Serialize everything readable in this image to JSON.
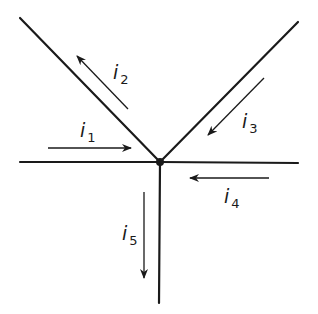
{
  "diagram": {
    "node": {
      "x": 160,
      "y": 162,
      "label": "junction"
    },
    "colors": {
      "line": "#1a1a1a",
      "background": "#ffffff"
    },
    "wires": [
      {
        "id": "left-horizontal",
        "x1": 20,
        "y1": 162,
        "x2": 160,
        "y2": 162
      },
      {
        "id": "right-horizontal",
        "x1": 160,
        "y1": 162,
        "x2": 298,
        "y2": 163
      },
      {
        "id": "left-diagonal",
        "x1": 20,
        "y1": 18,
        "x2": 160,
        "y2": 162
      },
      {
        "id": "right-diagonal",
        "x1": 298,
        "y1": 22,
        "x2": 160,
        "y2": 162
      },
      {
        "id": "vertical-down",
        "x1": 160,
        "y1": 162,
        "x2": 159,
        "y2": 303
      }
    ],
    "currents": [
      {
        "id": "i1",
        "symbol": "i",
        "subscript": "1",
        "direction": "into node (rightward)",
        "x1": 48,
        "y1": 148,
        "x2": 131,
        "y2": 148,
        "label_x": 80,
        "label_y": 137
      },
      {
        "id": "i2",
        "symbol": "i",
        "subscript": "2",
        "direction": "out of node (up-left)",
        "x1": 128,
        "y1": 109,
        "x2": 77,
        "y2": 56,
        "label_x": 113,
        "label_y": 79
      },
      {
        "id": "i3",
        "symbol": "i",
        "subscript": "3",
        "direction": "into node (down-left)",
        "x1": 264,
        "y1": 78,
        "x2": 208,
        "y2": 135,
        "label_x": 242,
        "label_y": 128
      },
      {
        "id": "i4",
        "symbol": "i",
        "subscript": "4",
        "direction": "into node (leftward)",
        "x1": 269,
        "y1": 178,
        "x2": 190,
        "y2": 178,
        "label_x": 224,
        "label_y": 203
      },
      {
        "id": "i5",
        "symbol": "i",
        "subscript": "5",
        "direction": "out of node (downward)",
        "x1": 144,
        "y1": 192,
        "x2": 144,
        "y2": 278,
        "label_x": 122,
        "label_y": 240
      }
    ]
  }
}
